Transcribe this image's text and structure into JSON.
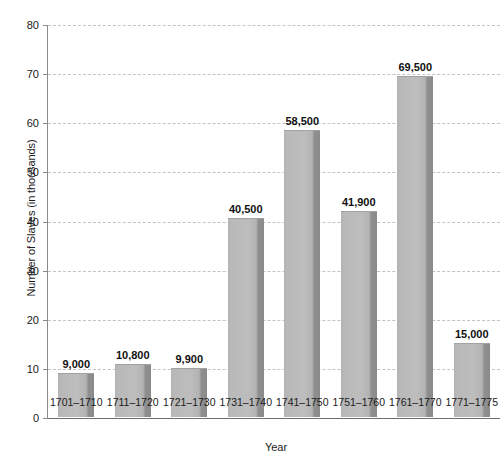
{
  "chart_data": {
    "type": "bar",
    "title": "",
    "xlabel": "Year",
    "ylabel": "Number of Slaves (in thousands)",
    "categories": [
      "1701–1710",
      "1711–1720",
      "1721–1730",
      "1731–1740",
      "1741–1750",
      "1751–1760",
      "1761–1770",
      "1771–1775"
    ],
    "values": [
      9.0,
      10.8,
      9.9,
      40.5,
      58.5,
      41.9,
      69.5,
      15.0
    ],
    "data_labels": [
      "9,000",
      "10,800",
      "9,900",
      "40,500",
      "58,500",
      "41,900",
      "69,500",
      "15,000"
    ],
    "ylim": [
      0,
      80
    ],
    "ytick_values": [
      0,
      10,
      20,
      30,
      40,
      50,
      60,
      70,
      80
    ],
    "ytick_labels": [
      "0",
      "10",
      "20",
      "30",
      "40",
      "50",
      "60",
      "70",
      "80"
    ],
    "grid": true,
    "grid_style": "dashed",
    "legend": "none",
    "bar_color": "#bdbdbd",
    "bar_edge_color": "#8a8a8a",
    "grid_color": "#c3c3c3",
    "axis_color": "#8a8a8a",
    "text_color": "#1a1a1a",
    "background": "#ffffff"
  }
}
